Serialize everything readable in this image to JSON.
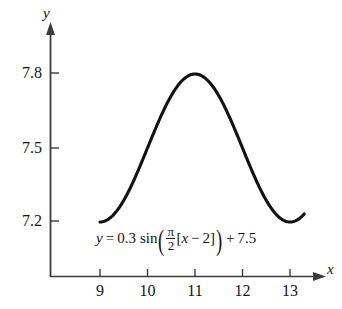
{
  "chart_data": {
    "type": "line",
    "title": "",
    "xlabel": "x",
    "ylabel": "y",
    "equation_text": "y = 0.3 sin((π/2)[x − 2]) + 7.5",
    "equation_parts": {
      "lhs": "y",
      "equals": "=",
      "amplitude": "0.3",
      "func": "sin",
      "open_paren": "(",
      "frac_numerator": "π",
      "frac_denominator": "2",
      "bracket_open": "[",
      "variable": "x",
      "minus": "−",
      "phase": "2",
      "bracket_close": "]",
      "close_paren": ")",
      "plus": "+",
      "vertical_shift": "7.5"
    },
    "xlim": [
      8.35,
      13.75
    ],
    "ylim": [
      7.07,
      7.9
    ],
    "x_ticks": [
      9,
      10,
      11,
      12,
      13
    ],
    "x_tick_labels": [
      "9",
      "10",
      "11",
      "12",
      "13"
    ],
    "y_ticks": [
      7.2,
      7.5,
      7.8
    ],
    "y_tick_labels": [
      "7.2",
      "7.5",
      "7.8"
    ],
    "grid": false,
    "legend": false,
    "curve_domain": [
      9.0,
      13.3
    ],
    "amplitude": 0.3,
    "period": 4,
    "midline": 7.5,
    "phase_shift": 2,
    "maximum": {
      "x": 11,
      "y": 7.8
    },
    "minimum_endpoints_y": 7.2,
    "x": [
      9.0,
      9.2,
      9.4,
      9.6,
      9.8,
      10.0,
      10.2,
      10.4,
      10.6,
      10.8,
      11.0,
      11.2,
      11.4,
      11.6,
      11.8,
      12.0,
      12.2,
      12.4,
      12.6,
      12.8,
      13.0,
      13.2,
      13.3
    ],
    "y": [
      7.2,
      7.205,
      7.221,
      7.247,
      7.282,
      7.324,
      7.373,
      7.426,
      7.481,
      7.537,
      7.593,
      7.646,
      7.694,
      7.736,
      7.771,
      7.796,
      7.812,
      7.818,
      7.813,
      7.799,
      7.774,
      7.741,
      7.721
    ],
    "colors": {
      "curve": "#111111",
      "axis": "#3b3b3b",
      "text": "#141414",
      "background": "#ffffff"
    }
  },
  "axes": {
    "y_axis_label": "y",
    "x_axis_label": "x"
  }
}
